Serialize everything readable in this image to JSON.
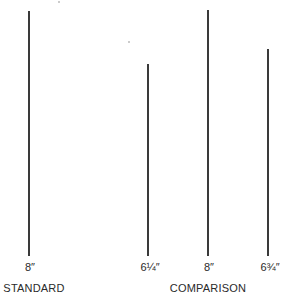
{
  "figure": {
    "lines": [
      {
        "id": "standard",
        "label": "8″",
        "length_in": 8,
        "x": 29,
        "top": 11,
        "bottom": 256
      },
      {
        "id": "comparison-1",
        "label": "6¼″",
        "length_in": 6.25,
        "x": 148,
        "top": 64,
        "bottom": 256
      },
      {
        "id": "comparison-2",
        "label": "8″",
        "length_in": 8,
        "x": 208,
        "top": 10,
        "bottom": 256
      },
      {
        "id": "comparison-3",
        "label": "6¾″",
        "length_in": 6.75,
        "x": 268,
        "top": 49,
        "bottom": 256
      }
    ],
    "groups": {
      "standard": "STANDARD",
      "comparison": "COMPARISON"
    }
  }
}
